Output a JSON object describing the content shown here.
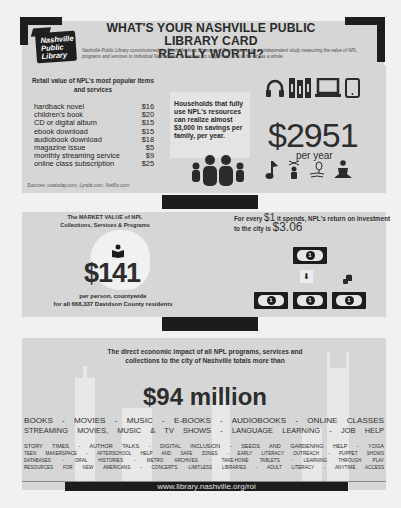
{
  "header": {
    "logo_lines": [
      "Nashville",
      "Public",
      "Library"
    ],
    "title_line1": "WHAT'S YOUR NASHVILLE PUBLIC LIBRARY CARD",
    "title_line2": "REALLY WORTH?",
    "subtitle": "Nashville Public Library commissioned the Nashville Area Chamber of Commerce to do an independent study measuring the value of NPL programs and services to individual Nashvillians, to families, to supporters, and to the city as a whole."
  },
  "retail": {
    "title": "Retail value of NPL's most popular items and services",
    "items": [
      {
        "name": "hardback novel",
        "price": "$16"
      },
      {
        "name": "children's book",
        "price": "$20"
      },
      {
        "name": "CD or digital album",
        "price": "$15"
      },
      {
        "name": "ebook download",
        "price": "$15"
      },
      {
        "name": "audiobook download",
        "price": "$18"
      },
      {
        "name": "magazine issue",
        "price": "$5"
      },
      {
        "name": "monthly streaming service",
        "price": "$9"
      },
      {
        "name": "online class subscription",
        "price": "$25"
      }
    ],
    "sources": "Sources: usatoday.com, Lynda.com, Netflix.com"
  },
  "household": {
    "text": "Households that fully use NPL's resources can realize almost $3,000 in savings per family, per year.",
    "amount": "$2951",
    "period": "per year",
    "icons_top": [
      "headphones-icon",
      "books-icon",
      "laptop-icon",
      "tablet-icon"
    ],
    "icons_bottom": [
      "music-note-icon",
      "puppet-icon",
      "seedling-hand-icon",
      "yoga-icon"
    ]
  },
  "market_value": {
    "title_line1": "The MARKET VALUE of NPL",
    "title_line2": "Collections, Services & Programs",
    "amount": "$141",
    "line1": "per person, countywide",
    "line2": "for all 668,337 Davidson County residents"
  },
  "roi": {
    "text_prefix": "For every ",
    "dollar": "$1",
    "text_mid": " it spends, NPL's return on investment to the city is ",
    "return": "$3.06",
    "bill_symbol": "1"
  },
  "impact": {
    "text": "The direct economic impact of all NPL programs, services and collections to the city of Nashville totals more than",
    "amount": "$94 million"
  },
  "services": [
    "BOOKS  -  MOVIES  -  MUSIC  -  E-BOOKS  -  AUDIOBOOKS  -  ONLINE  CLASSES",
    "STREAMING MOVIES, MUSIC & TV SHOWS - LANGUAGE LEARNING - JOB HELP",
    "STORY TIMES - AUTHOR TALKS - DIGITAL INCLUSION - SEEDS AND GARDENING HELP - YOGA",
    "TEEN MAKERSPACE - AFTERSCHOOL HELP AND SAFE ZONES - EARLY LITERACY OUTREACH - PUPPET SHOWS",
    "DATABASES  -  ORAL HISTORIES  -  METRO ARCHIVES  -  TAKE-HOME TABLETS  -  LEARNING THROUGH PLAY",
    "RESOURCES FOR NEW AMERICANS - CONCERTS -LIMITLESS LIBRARIES - ADULT LITERACY - ANYTIME ACCESS"
  ],
  "footer": {
    "url": "www.library.nashville.org/roi"
  },
  "colors": {
    "page_bg": "#f1f1f1",
    "panel_bg": "#d6d6d6",
    "dark": "#1c1c1c",
    "text": "#2b2b2b"
  }
}
